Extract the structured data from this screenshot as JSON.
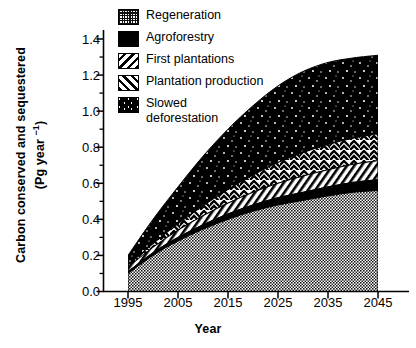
{
  "chart_data": {
    "type": "area",
    "title": "",
    "subtitle": "",
    "xlabel": "Year",
    "ylabel": "Carbon conserved and sequestered (Pg year -1)",
    "ylabel_line1": "Carbon conserved and sequestered",
    "ylabel_line2_pre": "(Pg year ",
    "ylabel_line2_sup": "−1",
    "ylabel_line2_post": ")",
    "stacked": true,
    "grid": false,
    "legend_position": "top-left-inside",
    "xlim": [
      1995,
      2045
    ],
    "ylim": [
      0.0,
      1.4
    ],
    "xticks": [
      1995,
      2005,
      2015,
      2025,
      2035,
      2045
    ],
    "xtick_labels": [
      "1995",
      "2005",
      "2015",
      "2025",
      "2035",
      "2045"
    ],
    "yticks": [
      0.0,
      0.2,
      0.4,
      0.6,
      0.8,
      1.0,
      1.2,
      1.4
    ],
    "ytick_labels": [
      "0.0",
      "0.2",
      "0.4",
      "0.6",
      "0.8",
      "1.0",
      "1.2",
      "1.4"
    ],
    "y_minor_ticks": [
      0.1,
      0.3,
      0.5,
      0.7,
      0.9,
      1.1,
      1.3
    ],
    "x": [
      1995,
      2000,
      2005,
      2010,
      2015,
      2020,
      2025,
      2030,
      2035,
      2040,
      2045
    ],
    "series": [
      {
        "name": "Regeneration",
        "pattern": "fine-dotted",
        "stack_order": 1,
        "values": [
          0.1,
          0.2,
          0.28,
          0.345,
          0.4,
          0.445,
          0.48,
          0.505,
          0.53,
          0.55,
          0.56
        ]
      },
      {
        "name": "Agroforestry",
        "pattern": "solid-black",
        "stack_order": 2,
        "values": [
          0.01,
          0.015,
          0.02,
          0.025,
          0.03,
          0.035,
          0.04,
          0.045,
          0.05,
          0.055,
          0.06
        ]
      },
      {
        "name": "Plantation production",
        "pattern": "diagonal-hatch",
        "stack_order": 3,
        "values": [
          0.025,
          0.03,
          0.04,
          0.05,
          0.06,
          0.07,
          0.08,
          0.09,
          0.095,
          0.1,
          0.105
        ]
      },
      {
        "name": "First plantations",
        "pattern": "chevron-hatch",
        "stack_order": 4,
        "values": [
          0.01,
          0.02,
          0.035,
          0.055,
          0.075,
          0.095,
          0.115,
          0.13,
          0.14,
          0.145,
          0.15
        ]
      },
      {
        "name": "Slowed deforestation",
        "pattern": "black-speckled",
        "stack_order": 5,
        "values": [
          0.055,
          0.135,
          0.205,
          0.275,
          0.335,
          0.385,
          0.425,
          0.45,
          0.455,
          0.445,
          0.435
        ]
      }
    ],
    "cumulative_tops": {
      "Regeneration": [
        0.1,
        0.2,
        0.28,
        0.345,
        0.4,
        0.445,
        0.48,
        0.505,
        0.53,
        0.55,
        0.56
      ],
      "Agroforestry": [
        0.11,
        0.215,
        0.3,
        0.37,
        0.43,
        0.48,
        0.52,
        0.55,
        0.58,
        0.605,
        0.62
      ],
      "Plantation production": [
        0.135,
        0.245,
        0.34,
        0.42,
        0.49,
        0.55,
        0.6,
        0.64,
        0.675,
        0.705,
        0.725
      ],
      "First plantations": [
        0.145,
        0.265,
        0.375,
        0.475,
        0.565,
        0.645,
        0.715,
        0.77,
        0.815,
        0.85,
        0.875
      ],
      "Slowed deforestation": [
        0.2,
        0.4,
        0.58,
        0.75,
        0.9,
        1.03,
        1.14,
        1.22,
        1.27,
        1.295,
        1.31
      ]
    },
    "legend_entries": [
      {
        "label": "Regeneration",
        "pattern": "fine-dotted"
      },
      {
        "label": "Agroforestry",
        "pattern": "solid-black"
      },
      {
        "label": "First plantations",
        "pattern": "chevron-hatch"
      },
      {
        "label": "Plantation production",
        "pattern": "diagonal-hatch"
      },
      {
        "label": "Slowed\ndeforestation",
        "pattern": "black-speckled"
      }
    ],
    "colors": {
      "axis": "#000000",
      "background": "#ffffff",
      "ink": "#000000"
    }
  }
}
